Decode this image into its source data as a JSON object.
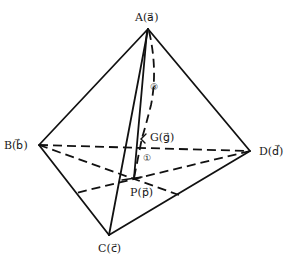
{
  "diagram": {
    "type": "tetrahedron",
    "vertices": {
      "A": {
        "label": "A",
        "vector": "a",
        "x": 148,
        "y": 29
      },
      "B": {
        "label": "B",
        "vector": "b",
        "x": 39,
        "y": 145
      },
      "C": {
        "label": "C",
        "vector": "c",
        "x": 109,
        "y": 235
      },
      "D": {
        "label": "D",
        "vector": "d",
        "x": 250,
        "y": 151
      }
    },
    "points": {
      "G": {
        "label": "G",
        "vector": "g",
        "x": 140,
        "y": 138
      },
      "P": {
        "label": "P",
        "vector": "p",
        "x": 134,
        "y": 178
      }
    },
    "ratio_markers": {
      "upper": "③",
      "lower": "①"
    },
    "labels": {
      "A": "A(a⃗)",
      "B": "B(b⃗)",
      "C": "C(c⃗)",
      "D": "D(d⃗)",
      "G": "G(g⃗)",
      "P": "P(p⃗)"
    },
    "solid_edges": [
      "AB",
      "AC",
      "AD",
      "BC",
      "CD",
      "AP"
    ],
    "dashed_edges": [
      "BD",
      "B-P-CD",
      "D-P-BC",
      "A-G-P"
    ],
    "line_color": "#111111",
    "background": "#ffffff"
  }
}
